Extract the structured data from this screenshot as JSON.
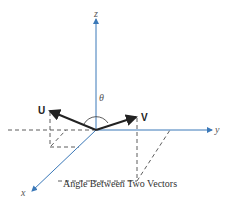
{
  "diagram": {
    "axes": {
      "x_label": "x",
      "y_label": "y",
      "z_label": "z"
    },
    "vectors": [
      {
        "name": "U"
      },
      {
        "name": "V"
      }
    ],
    "angle_label": "θ",
    "caption": "Angle Between Two Vectors",
    "colors": {
      "axis": "#3a78b8",
      "vector": "#222222",
      "dashed": "#333333"
    }
  }
}
